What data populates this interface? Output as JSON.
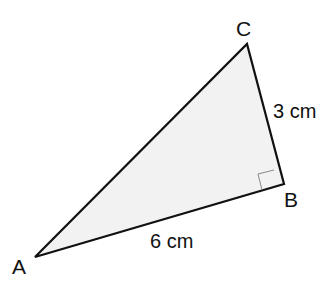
{
  "diagram": {
    "vertices": {
      "A": {
        "label": "A",
        "x": 35,
        "y": 257
      },
      "B": {
        "label": "B",
        "x": 284,
        "y": 184
      },
      "C": {
        "label": "C",
        "x": 247,
        "y": 44
      }
    },
    "sides": {
      "AB": {
        "label": "6 cm"
      },
      "BC": {
        "label": "3 cm"
      }
    },
    "right_angle_at": "B",
    "colors": {
      "fill": "#f2f2f2",
      "stroke": "#111111",
      "marker": "#888888"
    }
  }
}
